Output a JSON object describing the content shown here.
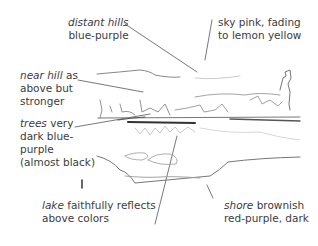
{
  "annotations": [
    {
      "id": "distant-hills",
      "term": "distant hills",
      "line1_rest": "",
      "line2": "blue-purple"
    },
    {
      "id": "sky",
      "term": "",
      "line1_rest": "sky pink, fading",
      "line2": "to lemon yellow"
    },
    {
      "id": "near-hill",
      "term": "near hill",
      "line1_rest": " as",
      "line2": "above but",
      "line3": "stronger"
    },
    {
      "id": "trees",
      "term": "trees",
      "line1_rest": " very",
      "line2": "dark blue-",
      "line3": "purple",
      "line4": "(almost black)"
    },
    {
      "id": "lake",
      "term": "lake",
      "line1_rest": " faithfully reflects",
      "line2": "above colors"
    },
    {
      "id": "shore",
      "term": "shore",
      "line1_rest": " brownish",
      "line2": "red-purple, dark"
    }
  ],
  "sketch": {
    "subject": "pencil sketch of lake landscape with hills, trees, reflection and shore",
    "stroke_color": "#555555"
  }
}
